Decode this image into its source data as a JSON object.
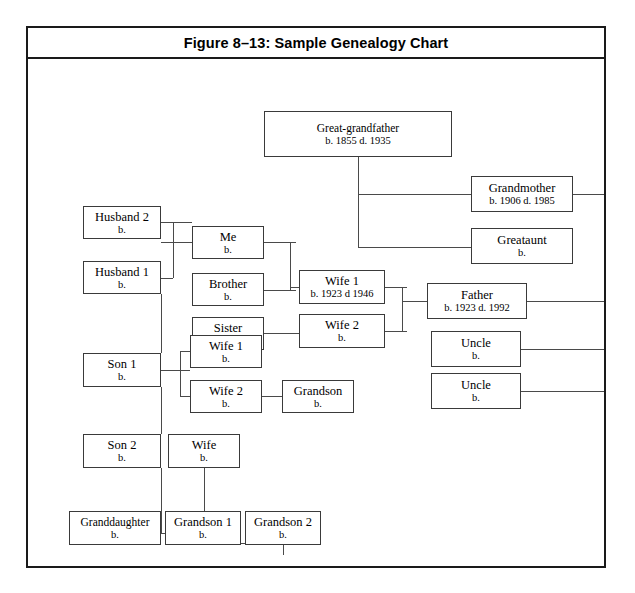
{
  "figure": {
    "title": "Figure 8–13: Sample Genealogy Chart",
    "frame_color": "#1a1a1a",
    "line_color": "#4a4a4a",
    "background": "#ffffff"
  },
  "chart_data": {
    "type": "diagram",
    "diagram_kind": "genealogy-tree",
    "title": "Figure 8–13: Sample Genealogy Chart",
    "nodes": [
      {
        "id": "great_grandfather",
        "name": "Great-grandfather",
        "dates": "b. 1855   d.  1935",
        "x": 236,
        "y": 52,
        "w": 188,
        "h": 46
      },
      {
        "id": "grandmother",
        "name": "Grandmother",
        "dates": "b. 1906  d. 1985",
        "x": 443,
        "y": 117,
        "w": 102,
        "h": 36
      },
      {
        "id": "greataunt",
        "name": "Greataunt",
        "dates": "b.",
        "x": 443,
        "y": 169,
        "w": 102,
        "h": 36
      },
      {
        "id": "father",
        "name": "Father",
        "dates": "b. 1923   d. 1992",
        "x": 399,
        "y": 224,
        "w": 100,
        "h": 36
      },
      {
        "id": "uncle_1",
        "name": "Uncle",
        "dates": "b.",
        "x": 403,
        "y": 272,
        "w": 90,
        "h": 36
      },
      {
        "id": "uncle_2",
        "name": "Uncle",
        "dates": "b.",
        "x": 403,
        "y": 314,
        "w": 90,
        "h": 36
      },
      {
        "id": "husband_2",
        "name": "Husband 2",
        "dates": "b.",
        "x": 55,
        "y": 147,
        "w": 78,
        "h": 33
      },
      {
        "id": "husband_1",
        "name": "Husband 1",
        "dates": "b.",
        "x": 55,
        "y": 202,
        "w": 78,
        "h": 33
      },
      {
        "id": "me",
        "name": "Me",
        "dates": "b.",
        "x": 164,
        "y": 167,
        "w": 72,
        "h": 33
      },
      {
        "id": "brother",
        "name": "Brother",
        "dates": "b.",
        "x": 164,
        "y": 214,
        "w": 72,
        "h": 33
      },
      {
        "id": "sister",
        "name": "Sister",
        "dates": "b.",
        "x": 164,
        "y": 258,
        "w": 72,
        "h": 33
      },
      {
        "id": "wife_1_top",
        "name": "Wife 1",
        "dates": "b. 1923 d 1946",
        "x": 271,
        "y": 211,
        "w": 86,
        "h": 34
      },
      {
        "id": "wife_2_top",
        "name": "Wife 2",
        "dates": "b.",
        "x": 271,
        "y": 255,
        "w": 86,
        "h": 34
      },
      {
        "id": "son_1",
        "name": "Son 1",
        "dates": "b.",
        "x": 55,
        "y": 294,
        "w": 78,
        "h": 34
      },
      {
        "id": "wife_1_son",
        "name": "Wife 1",
        "dates": "b.",
        "x": 162,
        "y": 276,
        "w": 72,
        "h": 33
      },
      {
        "id": "wife_2_son",
        "name": "Wife 2",
        "dates": "b.",
        "x": 162,
        "y": 321,
        "w": 72,
        "h": 33
      },
      {
        "id": "grandson_son1",
        "name": "Grandson",
        "dates": "b.",
        "x": 254,
        "y": 321,
        "w": 72,
        "h": 33
      },
      {
        "id": "son_2",
        "name": "Son 2",
        "dates": "b.",
        "x": 55,
        "y": 375,
        "w": 78,
        "h": 34
      },
      {
        "id": "wife_son2",
        "name": "Wife",
        "dates": "b.",
        "x": 140,
        "y": 375,
        "w": 72,
        "h": 34
      },
      {
        "id": "granddaughter",
        "name": "Granddaughter",
        "dates": "b.",
        "x": 41,
        "y": 452,
        "w": 92,
        "h": 34
      },
      {
        "id": "grandson_1",
        "name": "Grandson 1",
        "dates": "b.",
        "x": 137,
        "y": 452,
        "w": 76,
        "h": 34
      },
      {
        "id": "grandson_2",
        "name": "Grandson 2",
        "dates": "b.",
        "x": 217,
        "y": 452,
        "w": 76,
        "h": 34
      }
    ],
    "relations": [
      "great_grandfather -> grandmother",
      "great_grandfather -> greataunt",
      "grandmother -> father",
      "grandmother -> uncle_1",
      "grandmother -> uncle_2",
      "husband_2 -> me",
      "husband_1 -> me",
      "husband_1 -> son_1",
      "me -> wife_1_top",
      "brother -> wife_1_top",
      "sister -> wife_2_top",
      "wife_1_top -> father",
      "wife_2_top -> father",
      "son_1 -> wife_1_son",
      "son_1 -> wife_2_son",
      "wife_2_son -> grandson_son1",
      "son_1 -> son_2",
      "son_2 -> granddaughter",
      "son_2 -> grandson_1",
      "wife_son2 -> grandson_2"
    ]
  },
  "connectors": [
    {
      "o": "v",
      "x": 330,
      "y": 98,
      "len": 91
    },
    {
      "o": "h",
      "x": 330,
      "y": 135,
      "len": 113
    },
    {
      "o": "h",
      "x": 330,
      "y": 188,
      "len": 113
    },
    {
      "o": "h",
      "x": 545,
      "y": 135,
      "len": 35
    },
    {
      "o": "v",
      "x": 580,
      "y": 135,
      "len": 197
    },
    {
      "o": "h",
      "x": 499,
      "y": 242,
      "len": 81
    },
    {
      "o": "h",
      "x": 493,
      "y": 290,
      "len": 87
    },
    {
      "o": "h",
      "x": 493,
      "y": 332,
      "len": 87
    },
    {
      "o": "h",
      "x": 133,
      "y": 163,
      "len": 31
    },
    {
      "o": "v",
      "x": 145,
      "y": 163,
      "len": 56
    },
    {
      "o": "h",
      "x": 133,
      "y": 219,
      "len": 12
    },
    {
      "o": "h",
      "x": 133,
      "y": 183,
      "len": 31
    },
    {
      "o": "h",
      "x": 236,
      "y": 183,
      "len": 32
    },
    {
      "o": "v",
      "x": 262,
      "y": 183,
      "len": 48
    },
    {
      "o": "h",
      "x": 236,
      "y": 231,
      "len": 32
    },
    {
      "o": "h",
      "x": 262,
      "y": 228,
      "len": 9
    },
    {
      "o": "h",
      "x": 236,
      "y": 274,
      "len": 35
    },
    {
      "o": "h",
      "x": 357,
      "y": 228,
      "len": 22
    },
    {
      "o": "v",
      "x": 374,
      "y": 228,
      "len": 44
    },
    {
      "o": "h",
      "x": 357,
      "y": 272,
      "len": 22
    },
    {
      "o": "h",
      "x": 374,
      "y": 242,
      "len": 25
    },
    {
      "o": "v",
      "x": 133,
      "y": 235,
      "len": 59
    },
    {
      "o": "h",
      "x": 133,
      "y": 311,
      "len": 29
    },
    {
      "o": "v",
      "x": 152,
      "y": 292,
      "len": 45
    },
    {
      "o": "h",
      "x": 152,
      "y": 292,
      "len": 10
    },
    {
      "o": "h",
      "x": 152,
      "y": 337,
      "len": 10
    },
    {
      "o": "h",
      "x": 234,
      "y": 337,
      "len": 20
    },
    {
      "o": "v",
      "x": 133,
      "y": 328,
      "len": 47
    },
    {
      "o": "v",
      "x": 133,
      "y": 409,
      "len": 65
    },
    {
      "o": "h",
      "x": 87,
      "y": 474,
      "len": 88
    },
    {
      "o": "v",
      "x": 87,
      "y": 474,
      "len": 12
    },
    {
      "o": "v",
      "x": 174,
      "y": 474,
      "len": 12
    },
    {
      "o": "v",
      "x": 176,
      "y": 409,
      "len": 75
    },
    {
      "o": "h",
      "x": 176,
      "y": 484,
      "len": 79
    },
    {
      "o": "v",
      "x": 255,
      "y": 484,
      "len": 12
    }
  ]
}
